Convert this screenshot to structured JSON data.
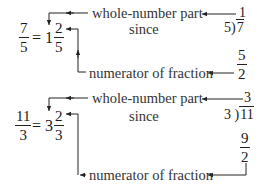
{
  "examples": [
    {
      "improper_fraction": {
        "numerator": "7",
        "denominator": "5"
      },
      "equals": "=",
      "mixed_number": {
        "whole": "1",
        "numerator": "2",
        "denominator": "5"
      },
      "whole_label": "whole-number part",
      "since_label": "since",
      "quotient": "1",
      "division": {
        "divisor": "5",
        "dividend": "7"
      },
      "product_remainder": {
        "product": "5",
        "remainder": "2"
      },
      "numerator_label": "numerator of fraction"
    },
    {
      "improper_fraction": {
        "numerator": "11",
        "denominator": "3"
      },
      "equals": "=",
      "mixed_number": {
        "whole": "3",
        "numerator": "2",
        "denominator": "3"
      },
      "whole_label": "whole-number part",
      "since_label": "since",
      "quotient": "3",
      "division": {
        "divisor": "3",
        "dividend": "11"
      },
      "product_remainder": {
        "product": "9",
        "remainder": "2"
      },
      "numerator_label": "numerator of fraction"
    }
  ],
  "colors": {
    "text": "#1a1a1a",
    "label": "#333333",
    "line": "#222222",
    "background": "#ffffff"
  }
}
